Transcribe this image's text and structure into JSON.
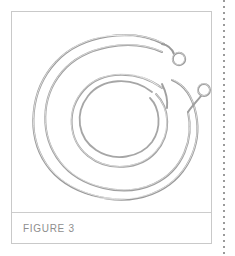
{
  "page": {
    "background_color": "#ffffff",
    "width": 235,
    "height": 256
  },
  "margin_rule": {
    "name": "dotted-margin-rule",
    "orientation": "vertical",
    "position": "right",
    "color": "#9a9a9a",
    "style": "dotted"
  },
  "figure_panel": {
    "border_color": "#c9c9c9",
    "background_color": "#ffffff",
    "caption": {
      "label": "FIGURE 3",
      "color": "#8e8e8e"
    }
  },
  "illustration": {
    "subject": "coiled-wire-cable",
    "description": "Thin coiled metal wire forming several concentric loops with two small terminal eyelet rings at the upper right",
    "line_color": "#9c9c9c",
    "highlight_color": "#e8e8e8",
    "shadow_color": "#b5b5b5",
    "components": [
      {
        "name": "outer-coil-loop",
        "type": "spiral"
      },
      {
        "name": "middle-coil-loop",
        "type": "spiral"
      },
      {
        "name": "inner-coil-loop",
        "type": "spiral"
      },
      {
        "name": "upper-terminal-eyelet",
        "type": "ring",
        "cx": 167,
        "cy": 48,
        "r": 6
      },
      {
        "name": "lower-terminal-eyelet",
        "type": "ring",
        "cx": 192,
        "cy": 79,
        "r": 6
      },
      {
        "name": "short-wire-stub",
        "type": "segment"
      }
    ]
  }
}
